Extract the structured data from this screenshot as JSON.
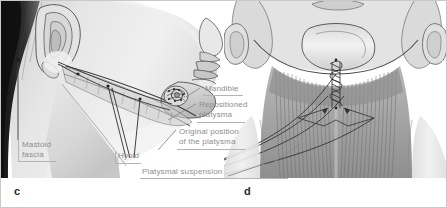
{
  "figure": {
    "kind": "medical-illustration",
    "title_hidden": "",
    "panels": [
      {
        "id": "c",
        "letter": "c",
        "view": "lateral profile of head and neck"
      },
      {
        "id": "d",
        "letter": "d",
        "view": "anterior view of neck with midline platysmaplasty"
      }
    ]
  },
  "labels": {
    "mandible": "Mandible",
    "repositioned_platysma": "Repositioned\nplatysma",
    "original_position": "Original position\nof the platysma",
    "mastoid_fascia": "Mastoid\nfascia",
    "hyoid": "Hyoid",
    "platysmal_suspension": "Platysmal suspension"
  },
  "colors": {
    "label_text": "#8d8d8d",
    "rule": "#b4b4b4",
    "panel_letter": "#2a2a2a",
    "leader_line": "#4a4a4a",
    "frame": "#c9c9c9",
    "skin_light": "#ededed",
    "skin_mid": "#d2d2d2",
    "skin_shadow": "#a8a8a8",
    "muscle": "#9a9a9a",
    "hair_dark": "#2b2b2b",
    "background": "#ffffff"
  }
}
